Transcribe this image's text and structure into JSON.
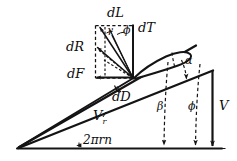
{
  "figure": {
    "background_color": "#ffffff",
    "ink_color": "#141414",
    "labels": {
      "lift": "dL",
      "thrust": "dT",
      "resultant": "dR",
      "tangential_force": "dF",
      "drag": "dD",
      "angle_of_attack": "α",
      "helix_angle": "β",
      "pitch_angle": "ϕ",
      "phi_top": "ϕ",
      "gamma_top": "γ",
      "relative_velocity": "V",
      "relative_velocity_sub": "r",
      "axial_velocity": "V",
      "rotational_velocity": "2πrn"
    }
  }
}
